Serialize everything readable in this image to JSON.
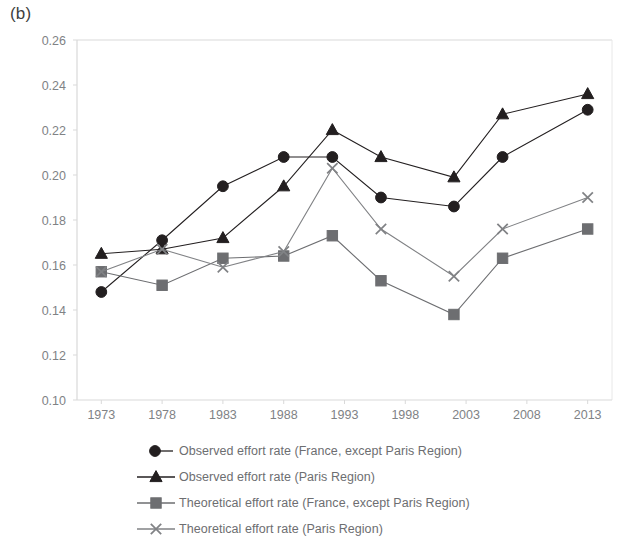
{
  "panel": {
    "label": "(b)"
  },
  "colors": {
    "observed_france": "#231f20",
    "observed_paris": "#231f20",
    "theoretical_france": "#6d6e71",
    "theoretical_paris": "#808285",
    "axis": "#d9d9d9",
    "tick_text": "#808285",
    "legend_text": "#6d6e71",
    "background": "#ffffff"
  },
  "legend": {
    "position": "below-plot",
    "items": [
      {
        "marker": "circle",
        "label": "Observed effort rate (France, except Paris Region)"
      },
      {
        "marker": "triangle",
        "label": "Observed effort rate (Paris Region)"
      },
      {
        "marker": "square",
        "label": "Theoretical effort rate (France, except Paris Region)"
      },
      {
        "marker": "cross",
        "label": "Theoretical effort rate (Paris Region)"
      }
    ]
  },
  "chart_data": {
    "type": "line",
    "title": "",
    "xlabel": "",
    "ylabel": "",
    "xlim": [
      1971,
      2015
    ],
    "ylim": [
      0.1,
      0.26
    ],
    "grid": false,
    "xticks": [
      1973,
      1978,
      1983,
      1988,
      1993,
      1998,
      2003,
      2008,
      2013
    ],
    "xtick_labels": [
      "1973",
      "1978",
      "1983",
      "1988",
      "1993",
      "1998",
      "2003",
      "2008",
      "2013"
    ],
    "yticks": [
      0.1,
      0.12,
      0.14,
      0.16,
      0.18,
      0.2,
      0.22,
      0.24,
      0.26
    ],
    "ytick_labels": [
      "0.10",
      "0.12",
      "0.14",
      "0.16",
      "0.18",
      "0.20",
      "0.22",
      "0.24",
      "0.26"
    ],
    "x": [
      1973,
      1978,
      1983,
      1988,
      1992,
      1996,
      2002,
      2006,
      2013
    ],
    "series": [
      {
        "name": "Observed effort rate (France, except Paris Region)",
        "marker": "circle",
        "color": "#231f20",
        "values": [
          0.148,
          0.171,
          0.195,
          0.208,
          0.208,
          0.19,
          0.186,
          0.208,
          0.229
        ]
      },
      {
        "name": "Observed effort rate (Paris Region)",
        "marker": "triangle",
        "color": "#231f20",
        "values": [
          0.165,
          0.167,
          0.172,
          0.195,
          0.22,
          0.208,
          0.199,
          0.227,
          0.236
        ]
      },
      {
        "name": "Theoretical effort rate (France, except Paris Region)",
        "marker": "square",
        "color": "#6d6e71",
        "values": [
          0.157,
          0.151,
          0.163,
          0.164,
          0.173,
          0.153,
          0.138,
          0.163,
          0.176
        ]
      },
      {
        "name": "Theoretical effort rate (Paris Region)",
        "marker": "cross",
        "color": "#808285",
        "values": [
          0.157,
          0.167,
          0.159,
          0.166,
          0.203,
          0.176,
          0.155,
          0.176,
          0.19
        ]
      }
    ]
  }
}
